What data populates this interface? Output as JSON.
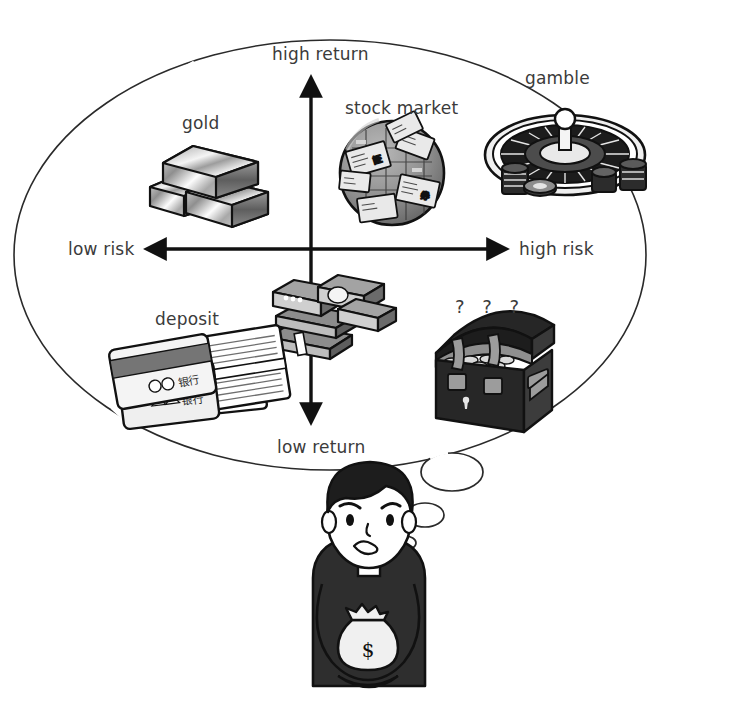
{
  "figure": {
    "kind": "risk-return-quadrant-thought-bubble",
    "background_color": "#ffffff",
    "ink_color": "#1a1a1a",
    "text_color": "#3b3b3b"
  },
  "axes": {
    "vertical": {
      "top_label": "high return",
      "bottom_label": "low return"
    },
    "horizontal": {
      "left_label": "low risk",
      "right_label": "high risk"
    },
    "origin": {
      "x": 311,
      "y": 249
    }
  },
  "items": [
    {
      "id": "gold",
      "label": "gold",
      "icon": "gold-bars-icon",
      "quadrant": "low-risk-high-return",
      "position": {
        "x": 215,
        "y": 175
      }
    },
    {
      "id": "stock_market",
      "label": "stock market",
      "icon": "stock-market-globe-icon",
      "quadrant": "high-risk-high-return",
      "position": {
        "x": 392,
        "y": 172
      }
    },
    {
      "id": "gamble",
      "label": "gamble",
      "icon": "roulette-wheel-icon",
      "quadrant": "high-risk-high-return",
      "position": {
        "x": 565,
        "y": 150
      }
    },
    {
      "id": "deposit",
      "label": "deposit",
      "icon": "bank-cards-passbook-icon",
      "quadrant": "low-risk-low-return",
      "position": {
        "x": 180,
        "y": 375
      }
    },
    {
      "id": "cash",
      "label": "",
      "icon": "cash-bundles-icon",
      "quadrant": "origin",
      "position": {
        "x": 313,
        "y": 320
      }
    },
    {
      "id": "unknown",
      "label": "? ? ?",
      "icon": "treasure-chest-icon",
      "quadrant": "high-risk-low-return",
      "position": {
        "x": 484,
        "y": 370
      }
    }
  ],
  "thinker": {
    "icon": "worried-person-icon",
    "holding": "money-bag-icon",
    "money_bag_symbol": "$",
    "expression": "worried",
    "hair_color": "#1f1f1f",
    "shirt_color": "#2c2c2c",
    "skin_color": "#ffffff"
  },
  "thought_bubble": {
    "shape": "ellipse",
    "center": {
      "x": 330,
      "y": 255
    },
    "radius_x": 316,
    "radius_y": 215,
    "tail_bubbles": [
      {
        "x": 452,
        "y": 472,
        "rx": 31,
        "ry": 19
      },
      {
        "x": 425,
        "y": 515,
        "rx": 19,
        "ry": 12
      },
      {
        "x": 405,
        "y": 543,
        "rx": 11,
        "ry": 7
      }
    ]
  }
}
